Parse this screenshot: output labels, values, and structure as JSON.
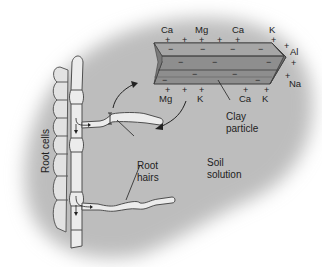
{
  "diagram": {
    "type": "soil cation exchange illustration",
    "background": {
      "soil_color": "#bdbdbd",
      "page_color": "#ffffff"
    },
    "labels": {
      "root_cells": "Root cells",
      "root_hairs_line1": "Root",
      "root_hairs_line2": "hairs",
      "clay_line1": "Clay",
      "clay_line2": "particle",
      "soil_line1": "Soil",
      "soil_line2": "solution"
    },
    "clay_particle": {
      "top_ions": [
        "Ca",
        "Mg",
        "Ca",
        "K"
      ],
      "right_ions": [
        "Al",
        "Na"
      ],
      "bottom_ions": [
        "Mg",
        "K",
        "Ca",
        "K"
      ],
      "surface_charge": "−",
      "adsorbed_charge": "+"
    },
    "colors": {
      "clay_face": "#8c8c8c",
      "clay_top": "#a8a8a8",
      "clay_end": "#6e6e6e",
      "root_fill": "#e4e4e4",
      "root_stroke": "#555555",
      "text": "#222222"
    }
  }
}
